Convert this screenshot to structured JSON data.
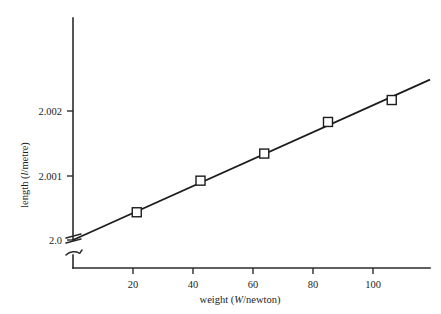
{
  "chart_data": {
    "type": "line",
    "title": "",
    "xlabel": "weight (W/newton)",
    "ylabel": "length (l/metre)",
    "xlabel_parts": {
      "prefix": "weight (",
      "symbol": "W",
      "suffix": "/newton)"
    },
    "ylabel_parts": {
      "prefix": "length (",
      "symbol": "l",
      "suffix": "/metre)"
    },
    "x": [
      20,
      40,
      60,
      80,
      100
    ],
    "values": [
      2.00043,
      2.00092,
      2.00134,
      2.00183,
      2.00217
    ],
    "series": [
      {
        "name": "length vs weight",
        "x": [
          20,
          40,
          60,
          80,
          100
        ],
        "values": [
          2.00043,
          2.00092,
          2.00134,
          2.00183,
          2.00217
        ]
      }
    ],
    "fit_line": {
      "intercept": 2.0,
      "slope": 2.22e-05,
      "x_start": 0,
      "x_end": 112
    },
    "xticks": [
      20,
      40,
      60,
      80,
      100
    ],
    "xtick_labels": [
      "20",
      "40",
      "60",
      "80",
      "100"
    ],
    "yticks": [
      2.0,
      2.001,
      2.002
    ],
    "ytick_labels": [
      "2.0",
      "2.001",
      "2.002"
    ],
    "xlim": [
      0,
      112
    ],
    "ylim": [
      2.0,
      2.0024
    ],
    "grid": false,
    "legend": "none",
    "axis_break": true,
    "marker_style": "open-square",
    "line_color": "#1c1c1c",
    "marker_fill": "#ffffff",
    "axis_color": "#2b2b2b",
    "background": "#ffffff"
  }
}
